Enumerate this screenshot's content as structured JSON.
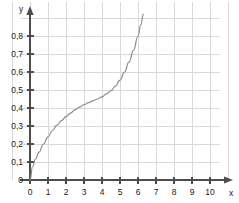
{
  "chart_data": {
    "type": "line",
    "title": "",
    "xlabel": "x",
    "ylabel": "y",
    "grid": true,
    "legend": null,
    "xlim": [
      0,
      10.6
    ],
    "ylim": [
      0,
      0.92
    ],
    "x_ticks": [
      0,
      1,
      2,
      3,
      4,
      5,
      6,
      7,
      8,
      9,
      10
    ],
    "x_tick_labels": [
      "0",
      "1",
      "2",
      "3",
      "4",
      "5",
      "6",
      "7",
      "8",
      "9",
      "10"
    ],
    "y_ticks": [
      0,
      0.1,
      0.2,
      0.3,
      0.4,
      0.5,
      0.6,
      0.7,
      0.8
    ],
    "y_tick_labels": [
      "0",
      "0,1",
      "0,2",
      "0,3",
      "0,4",
      "0,5",
      "0,6",
      "0,7",
      "0,8"
    ],
    "decimal_separator": ",",
    "series": [
      {
        "name": "curve",
        "color": "#8c8c8c",
        "x": [
          0,
          0.15,
          0.3,
          0.5,
          0.75,
          1.0,
          1.25,
          1.5,
          1.75,
          2.0,
          2.25,
          2.5,
          2.75,
          3.0,
          3.25,
          3.5,
          3.75,
          4.0,
          4.25,
          4.5,
          4.75,
          5.0,
          5.25,
          5.5,
          5.75,
          6.0,
          6.15,
          6.3
        ],
        "y": [
          0.0,
          0.075,
          0.115,
          0.155,
          0.2,
          0.24,
          0.275,
          0.305,
          0.33,
          0.352,
          0.372,
          0.39,
          0.405,
          0.418,
          0.43,
          0.44,
          0.45,
          0.462,
          0.478,
          0.497,
          0.522,
          0.555,
          0.6,
          0.655,
          0.72,
          0.8,
          0.86,
          0.92
        ]
      }
    ],
    "grid_color": "#d9d9d9",
    "axis_color": "#4d4d4d",
    "background": "#ffffff"
  },
  "axis_labels": {
    "x": "x",
    "y": "y"
  }
}
